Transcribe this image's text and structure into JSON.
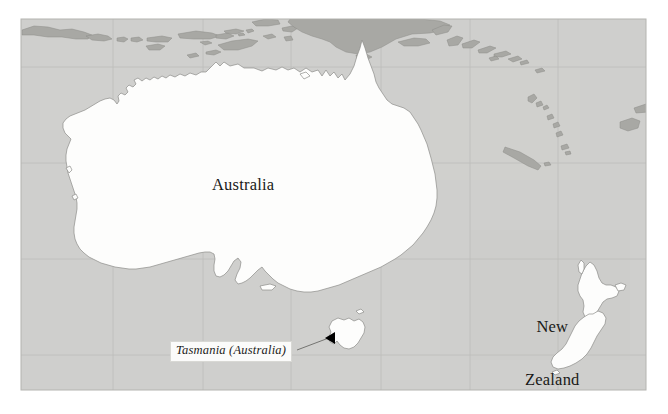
{
  "map": {
    "title": "Oceania region map",
    "frame": {
      "x": 21,
      "y": 19,
      "width": 625,
      "height": 371
    },
    "colors": {
      "page_background": "#ffffff",
      "ocean": "#cfcfcd",
      "land_highlight": "#fdfdfc",
      "land_other": "#a8a8a4",
      "coastline": "#8d8d89",
      "graticule": "#bdbdba",
      "frame_border": "#b4b4b0",
      "label_text": "#1a1a18",
      "callout_box_fill": "#fbfbfa",
      "callout_box_border": "#d8d8d4",
      "leader_line": "#6a6a66",
      "arrow_fill": "#000000"
    },
    "graticule": {
      "visible": true,
      "vertical_x": [
        113,
        203,
        291,
        381,
        470,
        558
      ],
      "horizontal_y": [
        67,
        163,
        259,
        355
      ]
    },
    "labels": [
      {
        "id": "australia",
        "text": "Australia",
        "style": "regular",
        "x": 212,
        "y": 176
      },
      {
        "id": "new_zealand",
        "lines": [
          "New",
          "Zealand"
        ],
        "style": "regular",
        "x": 525,
        "y": 282
      },
      {
        "id": "tasmania",
        "text": "Tasmania (Australia)",
        "style": "italic-callout",
        "x": 170,
        "y": 341
      }
    ],
    "callout": {
      "text": "Tasmania (Australia)",
      "leader_from": {
        "x": 299,
        "y": 348
      },
      "leader_to": {
        "x": 331,
        "y": 337
      },
      "arrow_tip": {
        "x": 329,
        "y": 338
      }
    },
    "features": {
      "highlighted": [
        "Australia",
        "Tasmania",
        "New Zealand North Island",
        "New Zealand South Island"
      ],
      "other_land": [
        "Java",
        "Bali",
        "Lombok",
        "Sumbawa",
        "Flores",
        "Timor",
        "Sulawesi",
        "Papua New Guinea",
        "New Britain",
        "Solomon Islands",
        "Vanuatu",
        "New Caledonia",
        "Fiji"
      ]
    }
  }
}
